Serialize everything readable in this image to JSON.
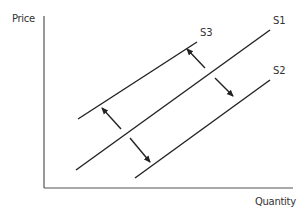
{
  "chart_data": {
    "type": "line",
    "title": "",
    "xlabel": "Quantity",
    "ylabel": "Price",
    "grid": false,
    "legend": "none",
    "axis_ticks": false,
    "series": [
      {
        "name": "S3",
        "x": [
          78,
          197
        ],
        "y": [
          119,
          42
        ],
        "label_pos": [
          201,
          38
        ]
      },
      {
        "name": "S1",
        "x": [
          76,
          270
        ],
        "y": [
          170,
          30
        ],
        "label_pos": [
          274,
          25
        ]
      },
      {
        "name": "S2",
        "x": [
          135,
          270
        ],
        "y": [
          178,
          80
        ],
        "label_pos": [
          274,
          75
        ]
      }
    ],
    "annotations": [
      {
        "type": "arrow",
        "direction": "up-left",
        "from": [
          121,
          129
        ],
        "to": [
          102,
          108
        ],
        "meaning": "shift S1 to S3"
      },
      {
        "type": "arrow",
        "direction": "down-right",
        "from": [
          130,
          138
        ],
        "to": [
          150,
          162
        ],
        "meaning": "shift S1 to S2"
      },
      {
        "type": "arrow",
        "direction": "up-left",
        "from": [
          205,
          68
        ],
        "to": [
          187,
          49
        ],
        "meaning": "shift S1 to S3"
      },
      {
        "type": "arrow",
        "direction": "down-right",
        "from": [
          215,
          78
        ],
        "to": [
          233,
          96
        ],
        "meaning": "shift S1 to S2"
      }
    ],
    "colors": {
      "line": "#222222",
      "axis": "#555555",
      "text": "#333333"
    }
  },
  "labels": {
    "y_axis": "Price",
    "x_axis": "Quantity",
    "s1": "S1",
    "s2": "S2",
    "s3": "S3"
  }
}
